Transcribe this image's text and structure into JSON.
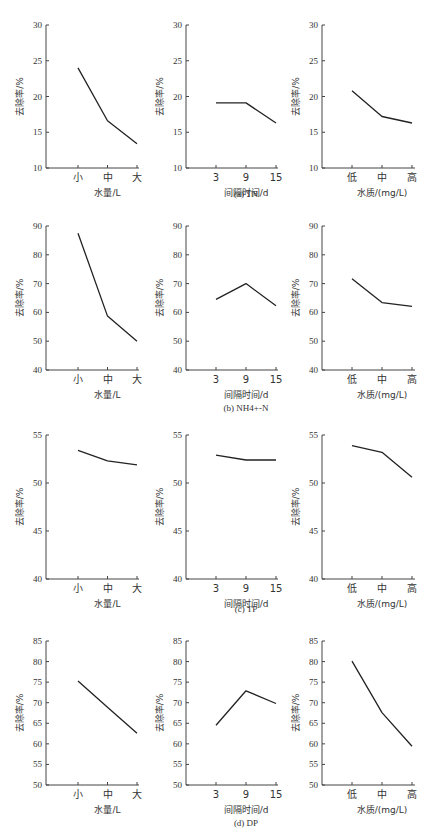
{
  "figure": {
    "ylabel": "去除率/%",
    "columns": [
      {
        "xlabel": "水量/L",
        "categories": [
          "小",
          "中",
          "大"
        ]
      },
      {
        "xlabel": "间隔时间/d",
        "categories": [
          "3",
          "9",
          "15"
        ]
      },
      {
        "xlabel": "水质/(mg/L)",
        "categories": [
          "低",
          "中",
          "高"
        ]
      }
    ],
    "rows": [
      {
        "caption": "(a)  TN",
        "ylim": [
          10,
          30
        ],
        "yticks": [
          10,
          15,
          20,
          25,
          30
        ]
      },
      {
        "caption": "(b)  NH4+-N",
        "ylim": [
          40,
          90
        ],
        "yticks": [
          40,
          50,
          60,
          70,
          80,
          90
        ]
      },
      {
        "caption": "(c)  TP",
        "ylim": [
          40,
          55
        ],
        "yticks": [
          40,
          45,
          50,
          55
        ]
      },
      {
        "caption": "(d)  DP",
        "ylim": [
          50,
          85
        ],
        "yticks": [
          50,
          55,
          60,
          65,
          70,
          75,
          80,
          85
        ]
      }
    ]
  },
  "chart_data": [
    {
      "type": "line",
      "title": "(a) TN",
      "xlabel": "水量/L",
      "ylabel": "去除率/%",
      "categories": [
        "小",
        "中",
        "大"
      ],
      "values": [
        24.0,
        16.6,
        13.4
      ],
      "ylim": [
        10,
        30
      ],
      "grid": false
    },
    {
      "type": "line",
      "title": "(a) TN",
      "xlabel": "间隔时间/d",
      "ylabel": "去除率/%",
      "categories": [
        "3",
        "9",
        "15"
      ],
      "values": [
        19.1,
        19.1,
        16.3
      ],
      "ylim": [
        10,
        30
      ],
      "grid": false
    },
    {
      "type": "line",
      "title": "(a) TN",
      "xlabel": "水质/(mg/L)",
      "ylabel": "去除率/%",
      "categories": [
        "低",
        "中",
        "高"
      ],
      "values": [
        20.8,
        17.2,
        16.3
      ],
      "ylim": [
        10,
        30
      ],
      "grid": false
    },
    {
      "type": "line",
      "title": "(b) NH4+-N",
      "xlabel": "水量/L",
      "ylabel": "去除率/%",
      "categories": [
        "小",
        "中",
        "大"
      ],
      "values": [
        87.5,
        58.7,
        50.0
      ],
      "ylim": [
        40,
        90
      ],
      "grid": false
    },
    {
      "type": "line",
      "title": "(b) NH4+-N",
      "xlabel": "间隔时间/d",
      "ylabel": "去除率/%",
      "categories": [
        "3",
        "9",
        "15"
      ],
      "values": [
        64.5,
        70.0,
        62.3
      ],
      "ylim": [
        40,
        90
      ],
      "grid": false
    },
    {
      "type": "line",
      "title": "(b) NH4+-N",
      "xlabel": "水质/(mg/L)",
      "ylabel": "去除率/%",
      "categories": [
        "低",
        "中",
        "高"
      ],
      "values": [
        71.7,
        63.4,
        62.1
      ],
      "ylim": [
        40,
        90
      ],
      "grid": false
    },
    {
      "type": "line",
      "title": "(c) TP",
      "xlabel": "水量/L",
      "ylabel": "去除率/%",
      "categories": [
        "小",
        "中",
        "大"
      ],
      "values": [
        53.4,
        52.3,
        51.9
      ],
      "ylim": [
        40,
        55
      ],
      "grid": false
    },
    {
      "type": "line",
      "title": "(c) TP",
      "xlabel": "间隔时间/d",
      "ylabel": "去除率/%",
      "categories": [
        "3",
        "9",
        "15"
      ],
      "values": [
        52.9,
        52.4,
        52.4
      ],
      "ylim": [
        40,
        55
      ],
      "grid": false
    },
    {
      "type": "line",
      "title": "(c) TP",
      "xlabel": "水质/(mg/L)",
      "ylabel": "去除率/%",
      "categories": [
        "低",
        "中",
        "高"
      ],
      "values": [
        53.9,
        53.2,
        50.6
      ],
      "ylim": [
        40,
        55
      ],
      "grid": false
    },
    {
      "type": "line",
      "title": "(d) DP",
      "xlabel": "水量/L",
      "ylabel": "去除率/%",
      "categories": [
        "小",
        "中",
        "大"
      ],
      "values": [
        75.3,
        68.9,
        62.6
      ],
      "ylim": [
        50,
        85
      ],
      "grid": false
    },
    {
      "type": "line",
      "title": "(d) DP",
      "xlabel": "间隔时间/d",
      "ylabel": "去除率/%",
      "categories": [
        "3",
        "9",
        "15"
      ],
      "values": [
        64.5,
        72.9,
        69.8
      ],
      "ylim": [
        50,
        85
      ],
      "grid": false
    },
    {
      "type": "line",
      "title": "(d) DP",
      "xlabel": "水质/(mg/L)",
      "ylabel": "去除率/%",
      "categories": [
        "低",
        "中",
        "高"
      ],
      "values": [
        80.1,
        67.6,
        59.4
      ],
      "ylim": [
        50,
        85
      ],
      "grid": false
    }
  ]
}
